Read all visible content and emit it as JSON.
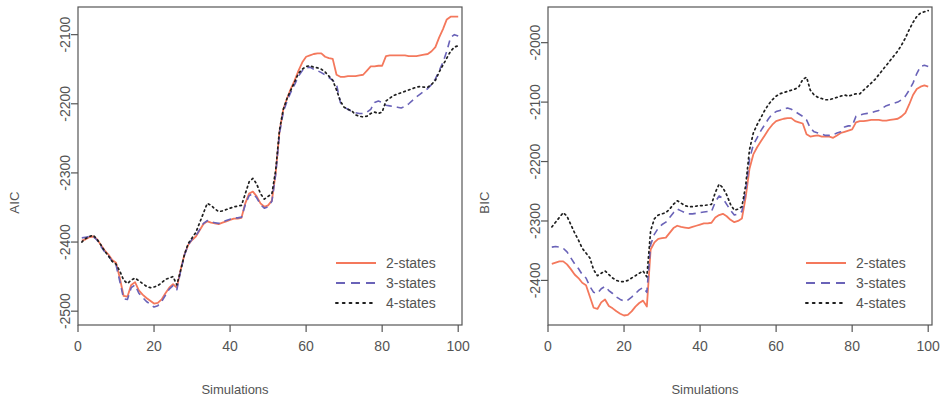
{
  "figure": {
    "panels": [
      "AIC",
      "BIC"
    ],
    "background": "#ffffff",
    "axis_color": "#555555",
    "text_color": "#545454"
  },
  "series_style": {
    "2-states": {
      "color": "#F4785C",
      "dash": "none",
      "width": 1.8
    },
    "3-states": {
      "color": "#6A63B8",
      "dash": "dashed",
      "width": 1.6
    },
    "4-states": {
      "color": "#1f1f1f",
      "dash": "dotted",
      "width": 1.7
    }
  },
  "legend": {
    "position": "bottom-right",
    "entries": [
      {
        "label": "2-states",
        "key": "2-states"
      },
      {
        "label": "3-states",
        "key": "3-states"
      },
      {
        "label": "4-states",
        "key": "4-states"
      }
    ]
  },
  "chart_data": [
    {
      "type": "line",
      "title": "",
      "xlabel": "Simulations",
      "ylabel": "AIC",
      "xlim": [
        0,
        101
      ],
      "ylim": [
        -2520,
        -2060
      ],
      "xticks": [
        0,
        20,
        40,
        60,
        80,
        100
      ],
      "yticks": [
        -2500,
        -2400,
        -2300,
        -2200,
        -2100
      ],
      "grid": false,
      "legend_position": "lower right",
      "x": [
        1,
        2,
        3,
        4,
        5,
        6,
        7,
        8,
        9,
        10,
        11,
        12,
        13,
        14,
        15,
        16,
        17,
        18,
        19,
        20,
        21,
        22,
        23,
        24,
        25,
        26,
        27,
        28,
        29,
        30,
        31,
        32,
        33,
        34,
        35,
        36,
        37,
        38,
        39,
        40,
        41,
        42,
        43,
        44,
        45,
        46,
        47,
        48,
        49,
        50,
        51,
        52,
        53,
        54,
        55,
        56,
        57,
        58,
        59,
        60,
        61,
        62,
        63,
        64,
        65,
        66,
        67,
        68,
        69,
        70,
        71,
        72,
        73,
        74,
        75,
        76,
        77,
        78,
        79,
        80,
        81,
        82,
        83,
        84,
        85,
        86,
        87,
        88,
        89,
        90,
        91,
        92,
        93,
        94,
        95,
        96,
        97,
        98,
        99,
        100
      ],
      "series": [
        {
          "name": "2-states",
          "values": [
            -2398,
            -2396,
            -2393,
            -2392,
            -2396,
            -2404,
            -2412,
            -2418,
            -2426,
            -2430,
            -2452,
            -2478,
            -2479,
            -2462,
            -2458,
            -2470,
            -2476,
            -2481,
            -2485,
            -2489,
            -2488,
            -2483,
            -2474,
            -2466,
            -2461,
            -2466,
            -2440,
            -2418,
            -2404,
            -2397,
            -2392,
            -2383,
            -2374,
            -2370,
            -2372,
            -2373,
            -2374,
            -2372,
            -2370,
            -2368,
            -2366,
            -2366,
            -2365,
            -2344,
            -2330,
            -2327,
            -2334,
            -2344,
            -2349,
            -2347,
            -2340,
            -2300,
            -2240,
            -2208,
            -2192,
            -2178,
            -2166,
            -2152,
            -2140,
            -2132,
            -2130,
            -2128,
            -2127,
            -2127,
            -2132,
            -2134,
            -2135,
            -2158,
            -2161,
            -2161,
            -2160,
            -2160,
            -2160,
            -2159,
            -2158,
            -2152,
            -2146,
            -2146,
            -2145,
            -2145,
            -2131,
            -2130,
            -2130,
            -2130,
            -2130,
            -2130,
            -2131,
            -2131,
            -2131,
            -2130,
            -2129,
            -2128,
            -2124,
            -2118,
            -2104,
            -2092,
            -2078,
            -2074,
            -2074,
            -2074
          ]
        },
        {
          "name": "3-states",
          "values": [
            -2394,
            -2393,
            -2392,
            -2392,
            -2397,
            -2406,
            -2414,
            -2420,
            -2428,
            -2433,
            -2457,
            -2482,
            -2483,
            -2466,
            -2462,
            -2474,
            -2480,
            -2486,
            -2490,
            -2494,
            -2492,
            -2486,
            -2477,
            -2468,
            -2463,
            -2469,
            -2442,
            -2419,
            -2404,
            -2396,
            -2391,
            -2382,
            -2373,
            -2369,
            -2371,
            -2372,
            -2373,
            -2371,
            -2369,
            -2367,
            -2365,
            -2365,
            -2364,
            -2346,
            -2333,
            -2330,
            -2336,
            -2346,
            -2351,
            -2349,
            -2341,
            -2302,
            -2243,
            -2212,
            -2196,
            -2183,
            -2172,
            -2160,
            -2152,
            -2148,
            -2147,
            -2150,
            -2152,
            -2155,
            -2158,
            -2162,
            -2166,
            -2172,
            -2198,
            -2205,
            -2208,
            -2211,
            -2213,
            -2214,
            -2214,
            -2212,
            -2208,
            -2198,
            -2196,
            -2198,
            -2202,
            -2203,
            -2204,
            -2205,
            -2206,
            -2204,
            -2200,
            -2195,
            -2190,
            -2186,
            -2182,
            -2178,
            -2172,
            -2164,
            -2152,
            -2140,
            -2124,
            -2104,
            -2100,
            -2102
          ]
        },
        {
          "name": "4-states",
          "values": [
            -2400,
            -2395,
            -2392,
            -2390,
            -2396,
            -2404,
            -2413,
            -2420,
            -2428,
            -2432,
            -2442,
            -2455,
            -2460,
            -2455,
            -2452,
            -2456,
            -2460,
            -2464,
            -2466,
            -2465,
            -2463,
            -2459,
            -2454,
            -2452,
            -2450,
            -2462,
            -2441,
            -2418,
            -2402,
            -2394,
            -2386,
            -2372,
            -2358,
            -2344,
            -2347,
            -2352,
            -2356,
            -2355,
            -2353,
            -2351,
            -2349,
            -2348,
            -2347,
            -2330,
            -2313,
            -2308,
            -2316,
            -2330,
            -2338,
            -2334,
            -2330,
            -2296,
            -2238,
            -2208,
            -2192,
            -2180,
            -2168,
            -2156,
            -2150,
            -2146,
            -2145,
            -2147,
            -2148,
            -2150,
            -2154,
            -2160,
            -2166,
            -2180,
            -2196,
            -2205,
            -2208,
            -2210,
            -2216,
            -2218,
            -2219,
            -2218,
            -2214,
            -2212,
            -2214,
            -2212,
            -2196,
            -2192,
            -2188,
            -2186,
            -2184,
            -2182,
            -2180,
            -2178,
            -2176,
            -2175,
            -2176,
            -2176,
            -2172,
            -2166,
            -2154,
            -2144,
            -2134,
            -2124,
            -2118,
            -2116
          ]
        }
      ]
    },
    {
      "type": "line",
      "title": "",
      "xlabel": "Simulations",
      "ylabel": "BIC",
      "xlim": [
        0,
        101
      ],
      "ylim": [
        -2475,
        -1940
      ],
      "xticks": [
        0,
        20,
        40,
        60,
        80,
        100
      ],
      "yticks": [
        -2400,
        -2300,
        -2200,
        -2100,
        -2000
      ],
      "grid": false,
      "legend_position": "lower right",
      "x": [
        1,
        2,
        3,
        4,
        5,
        6,
        7,
        8,
        9,
        10,
        11,
        12,
        13,
        14,
        15,
        16,
        17,
        18,
        19,
        20,
        21,
        22,
        23,
        24,
        25,
        26,
        27,
        28,
        29,
        30,
        31,
        32,
        33,
        34,
        35,
        36,
        37,
        38,
        39,
        40,
        41,
        42,
        43,
        44,
        45,
        46,
        47,
        48,
        49,
        50,
        51,
        52,
        53,
        54,
        55,
        56,
        57,
        58,
        59,
        60,
        61,
        62,
        63,
        64,
        65,
        66,
        67,
        68,
        69,
        70,
        71,
        72,
        73,
        74,
        75,
        76,
        77,
        78,
        79,
        80,
        81,
        82,
        83,
        84,
        85,
        86,
        87,
        88,
        89,
        90,
        91,
        92,
        93,
        94,
        95,
        96,
        97,
        98,
        99,
        100
      ],
      "series": [
        {
          "name": "2-states",
          "values": [
            -2372,
            -2370,
            -2368,
            -2368,
            -2373,
            -2381,
            -2390,
            -2396,
            -2404,
            -2408,
            -2427,
            -2446,
            -2448,
            -2437,
            -2432,
            -2443,
            -2447,
            -2452,
            -2456,
            -2459,
            -2458,
            -2452,
            -2444,
            -2438,
            -2434,
            -2444,
            -2348,
            -2336,
            -2330,
            -2329,
            -2328,
            -2320,
            -2312,
            -2308,
            -2310,
            -2311,
            -2312,
            -2310,
            -2308,
            -2306,
            -2304,
            -2304,
            -2303,
            -2294,
            -2290,
            -2288,
            -2292,
            -2298,
            -2302,
            -2300,
            -2296,
            -2260,
            -2212,
            -2188,
            -2176,
            -2166,
            -2156,
            -2146,
            -2138,
            -2132,
            -2130,
            -2128,
            -2127,
            -2127,
            -2132,
            -2134,
            -2136,
            -2154,
            -2158,
            -2157,
            -2156,
            -2158,
            -2158,
            -2158,
            -2160,
            -2156,
            -2152,
            -2150,
            -2148,
            -2146,
            -2134,
            -2132,
            -2132,
            -2131,
            -2130,
            -2130,
            -2130,
            -2131,
            -2131,
            -2130,
            -2129,
            -2128,
            -2124,
            -2118,
            -2104,
            -2088,
            -2078,
            -2074,
            -2072,
            -2074
          ]
        },
        {
          "name": "3-states",
          "values": [
            -2344,
            -2343,
            -2344,
            -2346,
            -2352,
            -2362,
            -2372,
            -2380,
            -2390,
            -2396,
            -2410,
            -2420,
            -2422,
            -2414,
            -2410,
            -2417,
            -2422,
            -2428,
            -2432,
            -2435,
            -2433,
            -2428,
            -2422,
            -2416,
            -2412,
            -2420,
            -2340,
            -2322,
            -2312,
            -2306,
            -2302,
            -2294,
            -2286,
            -2280,
            -2283,
            -2286,
            -2288,
            -2288,
            -2287,
            -2286,
            -2285,
            -2284,
            -2284,
            -2268,
            -2258,
            -2262,
            -2272,
            -2282,
            -2290,
            -2288,
            -2284,
            -2250,
            -2196,
            -2172,
            -2160,
            -2148,
            -2138,
            -2128,
            -2120,
            -2116,
            -2114,
            -2112,
            -2110,
            -2112,
            -2116,
            -2120,
            -2124,
            -2130,
            -2144,
            -2150,
            -2152,
            -2154,
            -2156,
            -2156,
            -2155,
            -2152,
            -2150,
            -2142,
            -2140,
            -2140,
            -2124,
            -2122,
            -2120,
            -2119,
            -2118,
            -2116,
            -2114,
            -2110,
            -2106,
            -2104,
            -2102,
            -2100,
            -2096,
            -2090,
            -2080,
            -2068,
            -2052,
            -2040,
            -2038,
            -2040
          ]
        },
        {
          "name": "4-states",
          "values": [
            -2310,
            -2302,
            -2294,
            -2286,
            -2292,
            -2306,
            -2320,
            -2332,
            -2346,
            -2354,
            -2362,
            -2382,
            -2392,
            -2388,
            -2384,
            -2390,
            -2396,
            -2400,
            -2402,
            -2402,
            -2400,
            -2396,
            -2392,
            -2388,
            -2384,
            -2394,
            -2316,
            -2296,
            -2290,
            -2288,
            -2286,
            -2280,
            -2272,
            -2266,
            -2270,
            -2274,
            -2276,
            -2276,
            -2275,
            -2274,
            -2274,
            -2273,
            -2272,
            -2252,
            -2238,
            -2244,
            -2256,
            -2272,
            -2282,
            -2280,
            -2276,
            -2240,
            -2180,
            -2152,
            -2138,
            -2126,
            -2114,
            -2104,
            -2096,
            -2090,
            -2086,
            -2084,
            -2082,
            -2080,
            -2078,
            -2074,
            -2062,
            -2058,
            -2080,
            -2088,
            -2092,
            -2094,
            -2096,
            -2096,
            -2094,
            -2092,
            -2090,
            -2088,
            -2090,
            -2088,
            -2086,
            -2086,
            -2080,
            -2074,
            -2068,
            -2062,
            -2054,
            -2046,
            -2038,
            -2030,
            -2022,
            -2014,
            -2004,
            -1992,
            -1978,
            -1966,
            -1956,
            -1950,
            -1948,
            -1946
          ]
        }
      ]
    }
  ]
}
